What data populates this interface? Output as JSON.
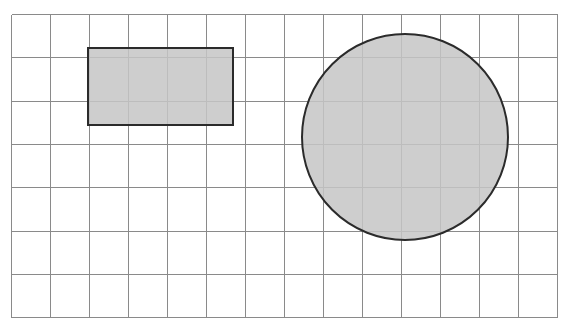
{
  "canvas": {
    "width": 568,
    "height": 332,
    "background": "#ffffff",
    "title": "Grid area diagram with shaded rectangle and circle"
  },
  "grid": {
    "name": "square-grid",
    "origin_x": 11,
    "origin_y": 14,
    "columns": 14,
    "rows": 7,
    "cell_width": 39,
    "cell_height": 43.3,
    "line_color": "#8a8a8a",
    "line_width": 1,
    "border_color": "#8a8a8a",
    "border_width": 1
  },
  "shapes": [
    {
      "id": "rectangle",
      "type": "rect",
      "label": "shaded-rectangle",
      "x": 88,
      "y": 48,
      "width": 145,
      "height": 77,
      "fill": "#c6c6c6",
      "stroke": "#2b2b2b",
      "stroke_width": 2,
      "cells_wide": 3.7,
      "cells_tall": 1.8
    },
    {
      "id": "circle",
      "type": "circle",
      "label": "shaded-circle",
      "center_x": 405,
      "center_y": 137,
      "radius": 103,
      "fill": "#c6c6c6",
      "stroke": "#2b2b2b",
      "stroke_width": 2,
      "diameter_cells": 5.3
    }
  ],
  "colors": {
    "shape_fill": "#c6c6c6",
    "shape_outline": "#2b2b2b",
    "grid_line": "#8a8a8a",
    "background": "#ffffff"
  }
}
